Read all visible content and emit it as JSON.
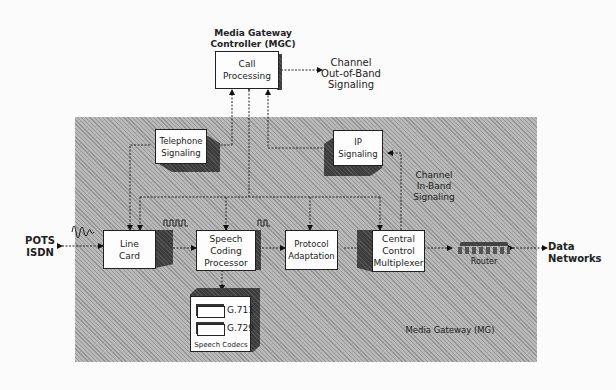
{
  "diagram": {
    "title_top": "Media Gateway Controller (MGC)",
    "container_label": "Media Gateway (MG)",
    "nodes": {
      "call_processing": "Call Processing",
      "telephone_signaling": "Telephone Signaling",
      "ip_signaling": "IP Signaling",
      "line_card": "Line Card",
      "speech_coding": "Speech Coding Processor",
      "protocol_adaptation": "Protocol Adaptation",
      "central_control": "Central Control Multiplexer",
      "router": "Router",
      "speech_codecs": "Speech Codecs"
    },
    "codecs": [
      "G.711",
      "G.729"
    ],
    "external": {
      "pots_isdn_line1": "POTS",
      "pots_isdn_line2": "ISDN",
      "data_networks_line1": "Data",
      "data_networks_line2": "Networks",
      "out_of_band_line1": "Channel",
      "out_of_band_line2": "Out-of-Band",
      "out_of_band_line3": "Signaling",
      "in_band_line1": "Channel",
      "in_band_line2": "In-Band",
      "in_band_line3": "Signaling"
    },
    "titles": {
      "mgc_line1": "Media Gateway",
      "mgc_line2": "Controller (MGC)"
    }
  }
}
